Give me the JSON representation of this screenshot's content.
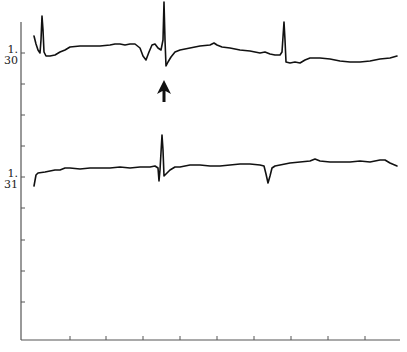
{
  "chart_data": {
    "type": "line",
    "title": "",
    "xlabel": "",
    "ylabel": "",
    "grid": false,
    "legend": null,
    "y_tick_labels": [
      {
        "label": "1.\n30",
        "line1": "1.",
        "line2": "30",
        "y_px": 53
      },
      {
        "label": "1.\n31",
        "line1": "1.",
        "line2": "31",
        "y_px": 177
      }
    ],
    "x_ticks_px": [
      70,
      106,
      143,
      180,
      217,
      254,
      291,
      328,
      365
    ],
    "y_ticks_px": [
      53,
      84,
      115,
      146,
      177,
      208,
      240,
      271,
      302
    ],
    "annotations": [
      {
        "type": "arrow",
        "direction": "up",
        "x_px": 164,
        "y_px_tip": 80,
        "points_to": "spike in trace 1.30"
      }
    ],
    "series": [
      {
        "name": "1.30",
        "color": "#111111",
        "points_px": [
          [
            34,
            36
          ],
          [
            36,
            44
          ],
          [
            38,
            50
          ],
          [
            40,
            53
          ],
          [
            41,
            40
          ],
          [
            42,
            16
          ],
          [
            43,
            30
          ],
          [
            44,
            52
          ],
          [
            46,
            56
          ],
          [
            50,
            56
          ],
          [
            55,
            55
          ],
          [
            60,
            52
          ],
          [
            65,
            50
          ],
          [
            70,
            47
          ],
          [
            80,
            46
          ],
          [
            90,
            46
          ],
          [
            100,
            46
          ],
          [
            110,
            45
          ],
          [
            115,
            44
          ],
          [
            120,
            44
          ],
          [
            125,
            45
          ],
          [
            130,
            44
          ],
          [
            135,
            44
          ],
          [
            140,
            48
          ],
          [
            143,
            56
          ],
          [
            146,
            60
          ],
          [
            149,
            52
          ],
          [
            152,
            45
          ],
          [
            155,
            44
          ],
          [
            158,
            48
          ],
          [
            161,
            50
          ],
          [
            163,
            40
          ],
          [
            164,
            2
          ],
          [
            165,
            40
          ],
          [
            166,
            66
          ],
          [
            168,
            62
          ],
          [
            171,
            57
          ],
          [
            175,
            52
          ],
          [
            180,
            50
          ],
          [
            190,
            48
          ],
          [
            200,
            46
          ],
          [
            210,
            45
          ],
          [
            214,
            43
          ],
          [
            217,
            45
          ],
          [
            222,
            47
          ],
          [
            230,
            48
          ],
          [
            240,
            50
          ],
          [
            250,
            51
          ],
          [
            260,
            53
          ],
          [
            265,
            52
          ],
          [
            270,
            54
          ],
          [
            275,
            55
          ],
          [
            280,
            55
          ],
          [
            282,
            52
          ],
          [
            284,
            22
          ],
          [
            285,
            40
          ],
          [
            286,
            62
          ],
          [
            290,
            63
          ],
          [
            295,
            62
          ],
          [
            300,
            63
          ],
          [
            305,
            60
          ],
          [
            310,
            58
          ],
          [
            320,
            58
          ],
          [
            330,
            59
          ],
          [
            340,
            61
          ],
          [
            350,
            62
          ],
          [
            360,
            62
          ],
          [
            370,
            61
          ],
          [
            380,
            59
          ],
          [
            390,
            58
          ],
          [
            397,
            56
          ]
        ]
      },
      {
        "name": "1.31",
        "color": "#111111",
        "points_px": [
          [
            34,
            186
          ],
          [
            36,
            175
          ],
          [
            38,
            173
          ],
          [
            45,
            172
          ],
          [
            50,
            171
          ],
          [
            55,
            170
          ],
          [
            60,
            170
          ],
          [
            65,
            168
          ],
          [
            70,
            168
          ],
          [
            80,
            169
          ],
          [
            90,
            168
          ],
          [
            100,
            168
          ],
          [
            110,
            168
          ],
          [
            120,
            167
          ],
          [
            130,
            168
          ],
          [
            140,
            167
          ],
          [
            150,
            167
          ],
          [
            155,
            166
          ],
          [
            158,
            168
          ],
          [
            159,
            181
          ],
          [
            160,
            170
          ],
          [
            162,
            135
          ],
          [
            163,
            150
          ],
          [
            164,
            176
          ],
          [
            166,
            174
          ],
          [
            170,
            170
          ],
          [
            175,
            167
          ],
          [
            180,
            167
          ],
          [
            185,
            166
          ],
          [
            190,
            165
          ],
          [
            200,
            165
          ],
          [
            210,
            166
          ],
          [
            220,
            166
          ],
          [
            230,
            165
          ],
          [
            240,
            164
          ],
          [
            250,
            164
          ],
          [
            260,
            165
          ],
          [
            264,
            166
          ],
          [
            266,
            174
          ],
          [
            268,
            183
          ],
          [
            270,
            176
          ],
          [
            272,
            168
          ],
          [
            275,
            166
          ],
          [
            280,
            165
          ],
          [
            290,
            163
          ],
          [
            300,
            162
          ],
          [
            310,
            161
          ],
          [
            315,
            159
          ],
          [
            320,
            161
          ],
          [
            330,
            162
          ],
          [
            340,
            162
          ],
          [
            350,
            162
          ],
          [
            360,
            161
          ],
          [
            370,
            162
          ],
          [
            380,
            160
          ],
          [
            385,
            160
          ],
          [
            390,
            163
          ],
          [
            397,
            166
          ]
        ]
      }
    ],
    "axes": {
      "x_axis": {
        "y_px": 340,
        "x_start_px": 21,
        "x_end_px": 400
      },
      "y_axis": {
        "x_px": 21,
        "y_start_px": 22,
        "y_end_px": 340
      }
    }
  }
}
